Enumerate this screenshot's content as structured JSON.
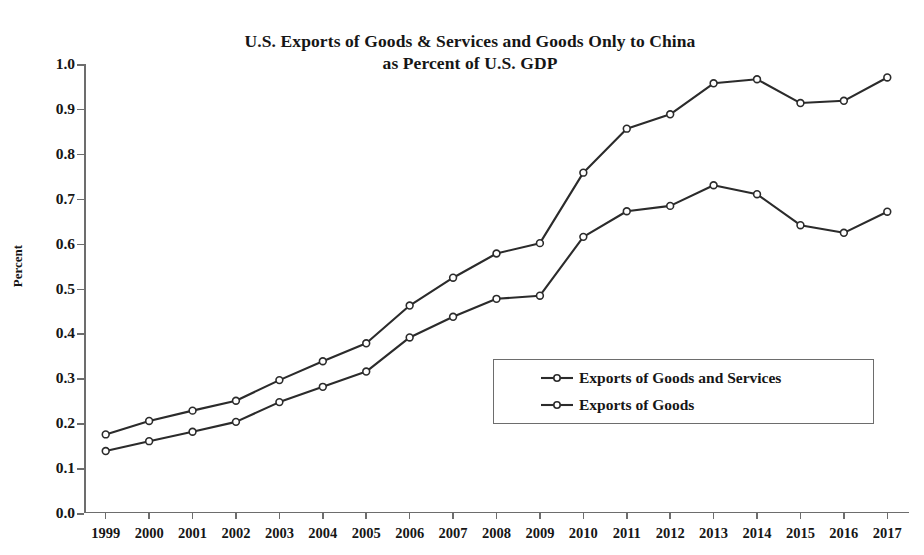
{
  "chart_data": {
    "type": "line",
    "title": "U.S. Exports of Goods & Services and Goods Only to China as Percent of U.S. GDP",
    "title_line1": "U.S. Exports of Goods & Services and Goods Only to China",
    "title_line2": "as Percent of U.S. GDP",
    "xlabel": "",
    "ylabel": "Percent",
    "ylim": [
      0.0,
      1.0
    ],
    "ytick_labels": [
      "0.0",
      "0.1",
      "0.2",
      "0.3",
      "0.4",
      "0.5",
      "0.6",
      "0.7",
      "0.8",
      "0.9",
      "1.0"
    ],
    "ytick_values": [
      0.0,
      0.1,
      0.2,
      0.3,
      0.4,
      0.5,
      0.6,
      0.7,
      0.8,
      0.9,
      1.0
    ],
    "grid": false,
    "legend_position": "lower-right-inside",
    "categories": [
      "1999",
      "2000",
      "2001",
      "2002",
      "2003",
      "2004",
      "2005",
      "2006",
      "2007",
      "2008",
      "2009",
      "2010",
      "2011",
      "2012",
      "2013",
      "2014",
      "2015",
      "2016",
      "2017"
    ],
    "x": [
      1999,
      2000,
      2001,
      2002,
      2003,
      2004,
      2005,
      2006,
      2007,
      2008,
      2009,
      2010,
      2011,
      2012,
      2013,
      2014,
      2015,
      2016,
      2017
    ],
    "series": [
      {
        "name": "Exports of Goods and Services",
        "marker": "open-circle",
        "color": "#2b2b2b",
        "values": [
          0.175,
          0.205,
          0.228,
          0.25,
          0.296,
          0.338,
          0.378,
          0.462,
          0.524,
          0.578,
          0.601,
          0.758,
          0.856,
          0.888,
          0.957,
          0.966,
          0.913,
          0.918,
          0.97
        ]
      },
      {
        "name": "Exports of Goods",
        "marker": "open-circle",
        "color": "#2b2b2b",
        "values": [
          0.138,
          0.16,
          0.181,
          0.203,
          0.247,
          0.281,
          0.315,
          0.391,
          0.437,
          0.477,
          0.484,
          0.615,
          0.672,
          0.684,
          0.73,
          0.71,
          0.641,
          0.624,
          0.671
        ]
      }
    ]
  },
  "legend": {
    "items": [
      {
        "label": "Exports of Goods and Services"
      },
      {
        "label": "Exports of Goods"
      }
    ]
  }
}
